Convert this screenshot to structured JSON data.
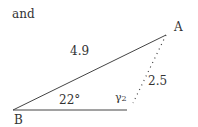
{
  "intro_word": "and",
  "vertices": {
    "A": "A",
    "B": "B"
  },
  "side_BA": "4.9",
  "side_A_dotted": "2.5",
  "angle_B": "22°",
  "angle_gamma": "γ",
  "angle_gamma_sub": "2"
}
